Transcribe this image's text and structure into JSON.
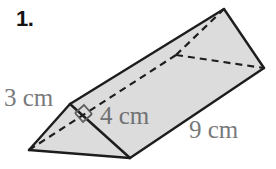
{
  "problem": {
    "number_label": "1.",
    "figure_type": "triangular-prism"
  },
  "dimensions": {
    "slant_side": "3 cm",
    "height": "4 cm",
    "length": "9 cm"
  },
  "colors": {
    "fill": "#dcdcdc",
    "outline": "#1d1d1d",
    "hidden_edge": "#1d1d1d",
    "label_text": "#78797b",
    "number_text": "#131313",
    "background": "#ffffff"
  },
  "geometry": {
    "front_left_apex": [
      29,
      150
    ],
    "front_top_vertex": [
      70,
      104
    ],
    "front_bottom_vertex": [
      130,
      158
    ],
    "back_top_apex": [
      224,
      9
    ],
    "back_right_vertex": [
      264,
      68
    ],
    "back_hidden_vertex": [
      176,
      55
    ],
    "right_angle_marker": [
      80,
      108
    ]
  }
}
